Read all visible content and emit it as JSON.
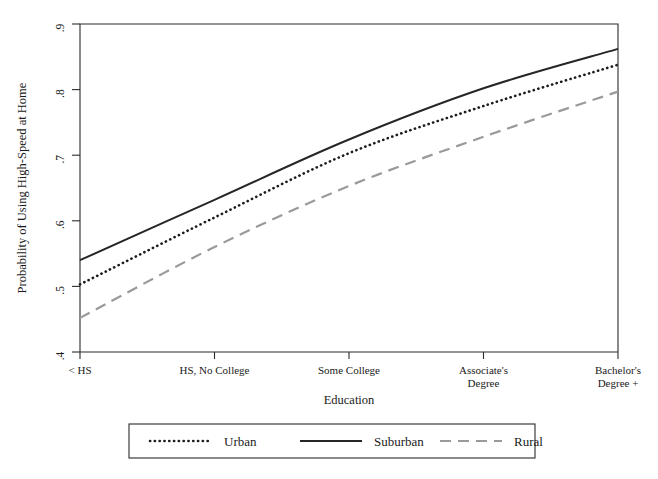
{
  "chart_data": {
    "type": "line",
    "title": "",
    "xlabel": "Education",
    "ylabel": "Probability of Using High-Speed at Home",
    "categories": [
      "< HS",
      "HS, No College",
      "Some College",
      "Associate's Degree",
      "Bachelor's Degree +"
    ],
    "category_lines": [
      [
        "< HS"
      ],
      [
        "HS, No College"
      ],
      [
        "Some College"
      ],
      [
        "Associate's",
        "Degree"
      ],
      [
        "Bachelor's",
        "Degree +"
      ]
    ],
    "ylim": [
      0.4,
      0.9
    ],
    "yticks": [
      0.4,
      0.5,
      0.6,
      0.7,
      0.8,
      0.9
    ],
    "ytick_labels": [
      ".4",
      ".5",
      ".6",
      ".7",
      ".8",
      ".9"
    ],
    "grid": false,
    "legend_position": "below",
    "series": [
      {
        "name": "Urban",
        "style": "dotted",
        "color": "#1c1c1c",
        "values": [
          0.503,
          0.605,
          0.703,
          0.775,
          0.838
        ]
      },
      {
        "name": "Suburban",
        "style": "solid",
        "color": "#262626",
        "values": [
          0.54,
          0.632,
          0.724,
          0.802,
          0.862
        ]
      },
      {
        "name": "Rural",
        "style": "dashed",
        "color": "#9a9a9a",
        "values": [
          0.452,
          0.56,
          0.653,
          0.728,
          0.797
        ]
      }
    ]
  },
  "legend": {
    "items": [
      {
        "label": "Urban",
        "style": "dotted"
      },
      {
        "label": "Suburban",
        "style": "solid"
      },
      {
        "label": "Rural",
        "style": "dashed"
      }
    ]
  }
}
